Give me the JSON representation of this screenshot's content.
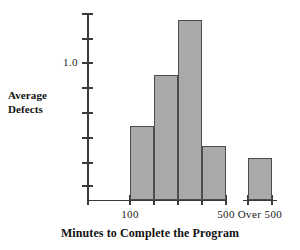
{
  "chart_data": {
    "type": "bar",
    "title": "",
    "xlabel": "Minutes to Complete the Program",
    "ylabel": "Average Defects",
    "categories": [
      "100",
      "200",
      "300",
      "400",
      "Over 500"
    ],
    "values": [
      0.6,
      0.91,
      1.48,
      0.44,
      0.38
    ],
    "ylim": [
      0,
      1.56
    ],
    "ytick_values": [
      0.25,
      0.5,
      0.75,
      1.0,
      1.25,
      1.5,
      1.75,
      2.0
    ],
    "ytick_labels": [
      "",
      "",
      "",
      "1.0",
      "",
      "",
      "",
      ""
    ],
    "xtick_labels": [
      "",
      "100",
      "",
      "",
      "",
      "500",
      "Over 500"
    ],
    "grid": false,
    "legend": false,
    "bar_color": "#a9a9a9",
    "bar_edge_color": "#4d4d4d",
    "axis_color": "#3a3a3a"
  },
  "y_axis": {
    "title": "Average Defects",
    "title_line1": "Average",
    "title_line2": "Defects",
    "ticks": [
      {
        "label": "",
        "y": 14
      },
      {
        "label": "",
        "y": 39
      },
      {
        "label": "1.0",
        "y": 63
      },
      {
        "label": "",
        "y": 88
      },
      {
        "label": "",
        "y": 113
      },
      {
        "label": "",
        "y": 138
      },
      {
        "label": "",
        "y": 163
      },
      {
        "label": "",
        "y": 186
      }
    ]
  },
  "x_axis": {
    "title": "Minutes to Complete the Program",
    "labels": [
      {
        "text": "100",
        "x": 130
      },
      {
        "text": "500",
        "x": 226
      },
      {
        "text": "Over 500",
        "x": 260
      }
    ],
    "ticks": [
      88,
      130,
      154,
      178,
      202,
      226,
      248,
      272
    ]
  },
  "bars": [
    {
      "name": "bar-100",
      "left": 130,
      "width": 24,
      "top": 126,
      "height": 74
    },
    {
      "name": "bar-200",
      "left": 154,
      "width": 24,
      "top": 75,
      "height": 125
    },
    {
      "name": "bar-300",
      "left": 178,
      "width": 24,
      "top": 20,
      "height": 180
    },
    {
      "name": "bar-400",
      "left": 202,
      "width": 24,
      "top": 146,
      "height": 54
    },
    {
      "name": "bar-over-500",
      "left": 248,
      "width": 24,
      "top": 158,
      "height": 42
    }
  ]
}
